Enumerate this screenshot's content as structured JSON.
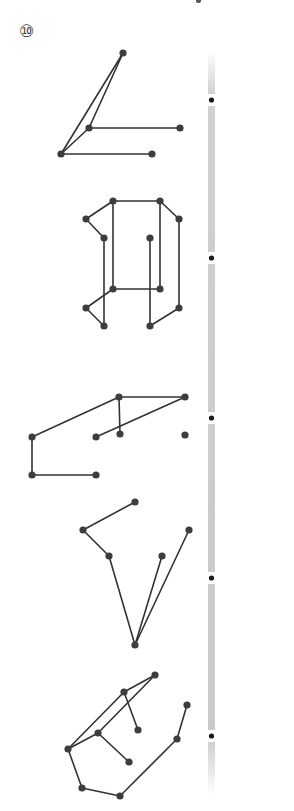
{
  "problem": {
    "number_label": "⑩"
  },
  "colors": {
    "line": "#333333",
    "point": "#3d3d3d",
    "bar": "#c8c8c8",
    "bar_dot": "#1a1a1a"
  },
  "divider_bar": {
    "x": 208,
    "width": 7,
    "top": 50,
    "bottom": 795,
    "dots_y": [
      100,
      258,
      418,
      578,
      736
    ]
  },
  "figures": [
    {
      "id": "figure-1",
      "points": [
        [
          123,
          53
        ],
        [
          89,
          128
        ],
        [
          180,
          128
        ],
        [
          61,
          154
        ],
        [
          152,
          154
        ]
      ],
      "segments": [
        [
          123,
          53,
          61,
          154
        ],
        [
          123,
          53,
          89,
          128
        ],
        [
          89,
          128,
          61,
          154
        ],
        [
          89,
          128,
          180,
          128
        ],
        [
          61,
          154,
          152,
          154
        ]
      ]
    },
    {
      "id": "figure-2",
      "points": [
        [
          113,
          201
        ],
        [
          160,
          201
        ],
        [
          86,
          219
        ],
        [
          179,
          219
        ],
        [
          104,
          238
        ],
        [
          150,
          238
        ],
        [
          113,
          289
        ],
        [
          160,
          289
        ],
        [
          86,
          308
        ],
        [
          179,
          308
        ],
        [
          104,
          326
        ],
        [
          150,
          326
        ]
      ],
      "segments": [
        [
          86,
          219,
          113,
          201
        ],
        [
          113,
          201,
          160,
          201
        ],
        [
          160,
          201,
          179,
          219
        ],
        [
          86,
          219,
          104,
          238
        ],
        [
          113,
          201,
          113,
          289
        ],
        [
          160,
          201,
          160,
          289
        ],
        [
          179,
          219,
          179,
          308
        ],
        [
          104,
          238,
          104,
          326
        ],
        [
          150,
          238,
          150,
          326
        ],
        [
          113,
          289,
          160,
          289
        ],
        [
          113,
          289,
          86,
          308
        ],
        [
          86,
          308,
          104,
          326
        ],
        [
          179,
          308,
          150,
          326
        ]
      ]
    },
    {
      "id": "figure-3",
      "points": [
        [
          119,
          397
        ],
        [
          185,
          397
        ],
        [
          32,
          437
        ],
        [
          96,
          437
        ],
        [
          120,
          434
        ],
        [
          185,
          435
        ],
        [
          32,
          475
        ],
        [
          96,
          475
        ]
      ],
      "segments": [
        [
          32,
          437,
          119,
          397
        ],
        [
          119,
          397,
          185,
          397
        ],
        [
          119,
          397,
          120,
          434
        ],
        [
          185,
          397,
          96,
          437
        ],
        [
          32,
          437,
          32,
          475
        ],
        [
          32,
          475,
          96,
          475
        ]
      ]
    },
    {
      "id": "figure-4",
      "points": [
        [
          135,
          502
        ],
        [
          83,
          530
        ],
        [
          189,
          530
        ],
        [
          109,
          556
        ],
        [
          162,
          556
        ],
        [
          135,
          645
        ]
      ],
      "segments": [
        [
          135,
          502,
          83,
          530
        ],
        [
          83,
          530,
          109,
          556
        ],
        [
          109,
          556,
          135,
          645
        ],
        [
          162,
          556,
          135,
          645
        ],
        [
          189,
          530,
          135,
          645
        ]
      ]
    },
    {
      "id": "figure-5",
      "points": [
        [
          155,
          675
        ],
        [
          124,
          692
        ],
        [
          187,
          705
        ],
        [
          98,
          733
        ],
        [
          138,
          730
        ],
        [
          177,
          739
        ],
        [
          68,
          749
        ],
        [
          129,
          762
        ],
        [
          82,
          788
        ],
        [
          120,
          796
        ]
      ],
      "segments": [
        [
          155,
          675,
          124,
          692
        ],
        [
          155,
          675,
          98,
          733
        ],
        [
          124,
          692,
          68,
          749
        ],
        [
          124,
          692,
          138,
          730
        ],
        [
          98,
          733,
          68,
          749
        ],
        [
          98,
          733,
          129,
          762
        ],
        [
          68,
          749,
          82,
          788
        ],
        [
          82,
          788,
          120,
          796
        ],
        [
          120,
          796,
          177,
          739
        ],
        [
          177,
          739,
          187,
          705
        ]
      ]
    }
  ]
}
